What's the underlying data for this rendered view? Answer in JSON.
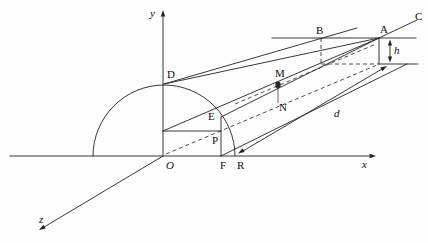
{
  "axes": {
    "x": "x",
    "y": "y",
    "z": "z",
    "origin": "O"
  },
  "points": {
    "A": "A",
    "B": "B",
    "C": "C",
    "D": "D",
    "E": "E",
    "F": "F",
    "M": "M",
    "N": "N",
    "P": "P",
    "R": "R"
  },
  "dimensions": {
    "height": "h",
    "depth": "d"
  },
  "colors": {
    "stroke": "#222222",
    "background": "#fdfdfd"
  }
}
